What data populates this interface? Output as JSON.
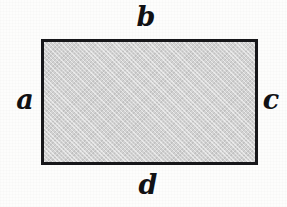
{
  "figure": {
    "type": "geometric-diagram",
    "shape": "rectangle",
    "background_color": "#fdfdfc",
    "fill_color": "#d3d3d3",
    "stroke_color": "#17171a",
    "stroke_width": 3,
    "bounds": {
      "left": 41,
      "top": 39,
      "width": 217,
      "height": 126
    },
    "labels": {
      "top": "b",
      "left": "a",
      "right": "c",
      "bottom": "d"
    },
    "label_style": {
      "color": "#111114",
      "font_style": "italic",
      "font_size": 27
    }
  }
}
